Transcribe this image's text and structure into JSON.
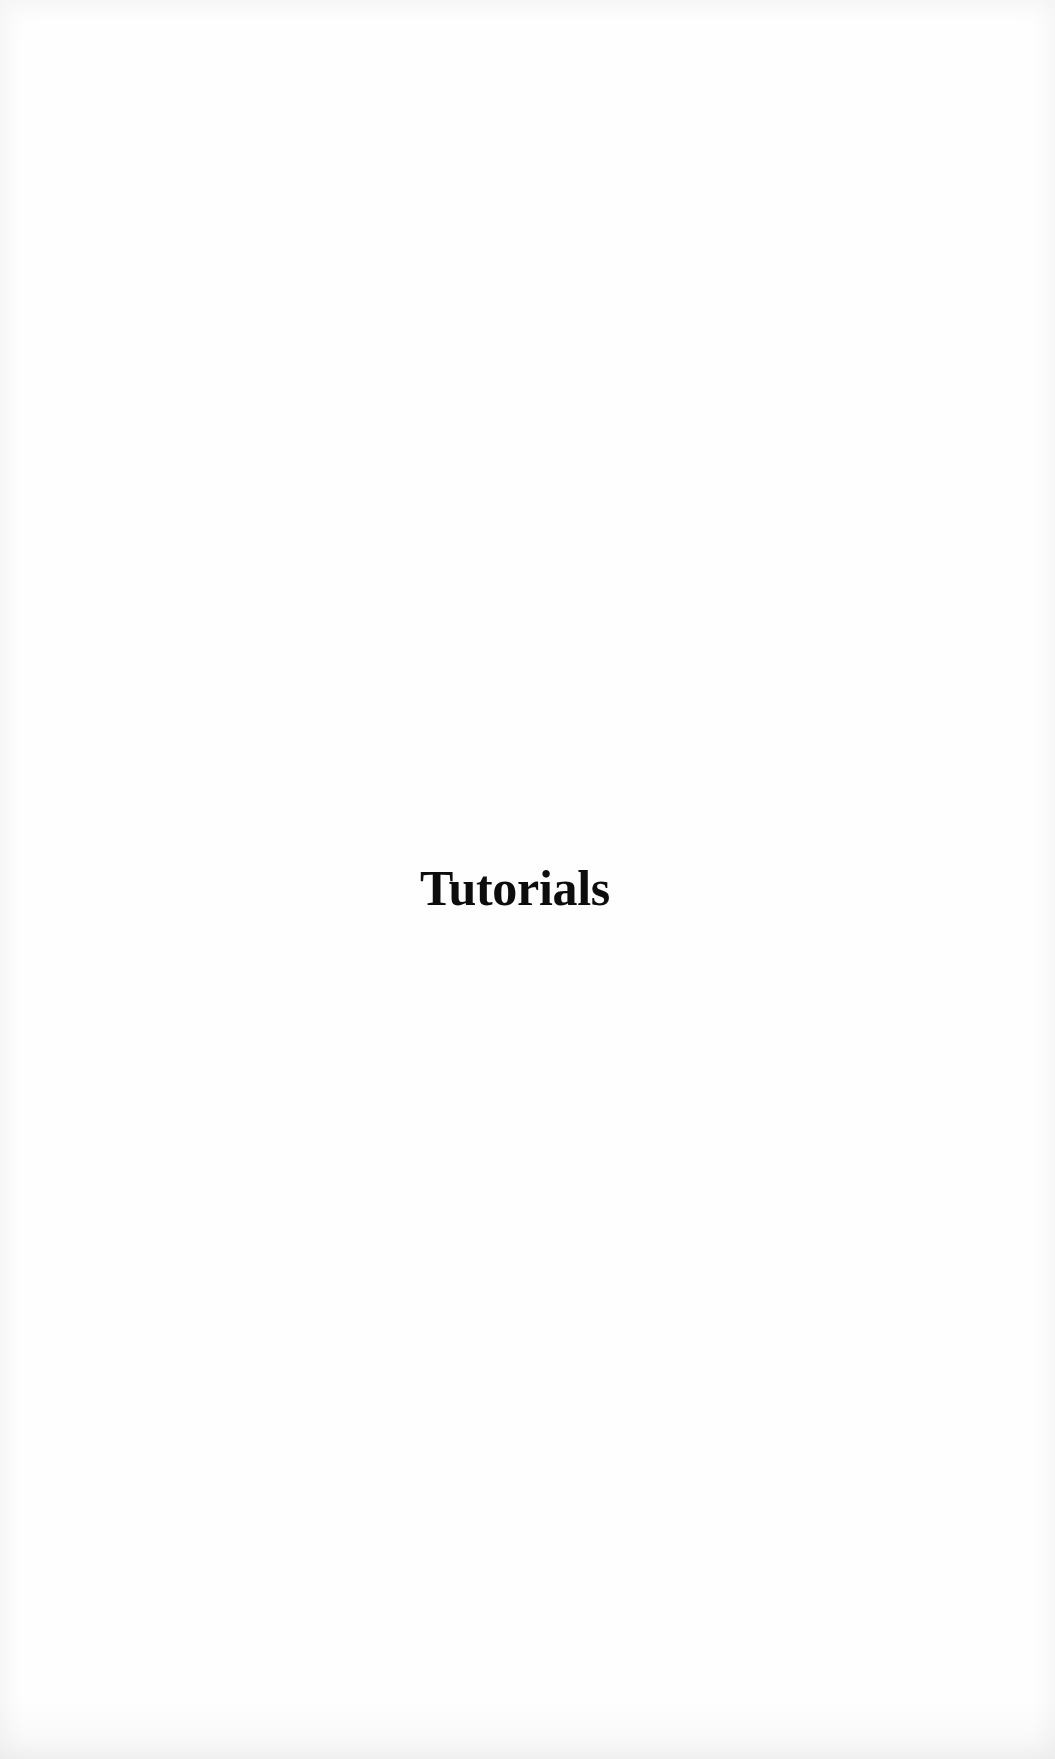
{
  "page": {
    "title": "Tutorials"
  }
}
